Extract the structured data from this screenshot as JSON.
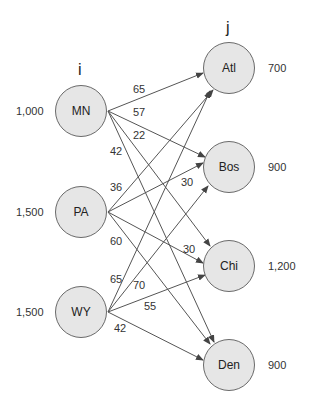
{
  "headers": {
    "sources": "i",
    "destinations": "j"
  },
  "sources": [
    {
      "id": "MN",
      "label": "MN",
      "supply": "1,000"
    },
    {
      "id": "PA",
      "label": "PA",
      "supply": "1,500"
    },
    {
      "id": "WY",
      "label": "WY",
      "supply": "1,500"
    }
  ],
  "destinations": [
    {
      "id": "Atl",
      "label": "Atl",
      "demand": "700"
    },
    {
      "id": "Bos",
      "label": "Bos",
      "demand": "900"
    },
    {
      "id": "Chi",
      "label": "Chi",
      "demand": "1,200"
    },
    {
      "id": "Den",
      "label": "Den",
      "demand": "900"
    }
  ],
  "edges": [
    {
      "from": "MN",
      "to": "Atl",
      "cost": "65"
    },
    {
      "from": "MN",
      "to": "Bos",
      "cost": "57"
    },
    {
      "from": "MN",
      "to": "Chi",
      "cost": "22"
    },
    {
      "from": "MN",
      "to": "Den",
      "cost": "42"
    },
    {
      "from": "PA",
      "to": "Atl",
      "cost": "36"
    },
    {
      "from": "PA",
      "to": "Bos",
      "cost": "30"
    },
    {
      "from": "PA",
      "to": "Chi",
      "cost": "30"
    },
    {
      "from": "PA",
      "to": "Den",
      "cost": "60"
    },
    {
      "from": "WY",
      "to": "Atl",
      "cost": "65"
    },
    {
      "from": "WY",
      "to": "Bos",
      "cost": "70"
    },
    {
      "from": "WY",
      "to": "Chi",
      "cost": "55"
    },
    {
      "from": "WY",
      "to": "Den",
      "cost": "42"
    }
  ],
  "colors": {
    "node_fill": "#e6e6e6",
    "node_stroke": "#6a6a6a",
    "edge": "#444444",
    "text": "#333333"
  }
}
